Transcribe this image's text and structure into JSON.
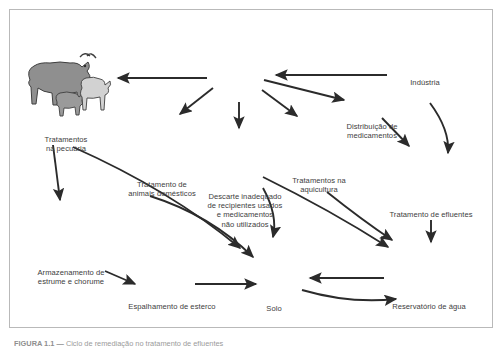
{
  "figure": {
    "type": "diagram",
    "background_color": "#ffffff",
    "border_color": "#b9b9b9",
    "text_color": "#3d3d3d",
    "arrow_color": "#2b2b2b"
  },
  "caption": {
    "label": "FIGURA 1.1 —",
    "text": "Ciclo de remediação no tratamento de efluentes"
  },
  "nodes": [
    {
      "id": "cattle",
      "icon": "cow-goat-icon",
      "label": "Tratamentos\nna pecuária"
    },
    {
      "id": "pets",
      "icon": "dog-cat-basket-icon",
      "label": "Tratamento de\nanimais domésticos"
    },
    {
      "id": "pills",
      "icon": "medicine-bottle-pills-icon",
      "label": ""
    },
    {
      "id": "trash",
      "icon": "trash-can-icon",
      "label": "Descarte inadequado\nde recipientes usados\ne medicamentos\nnão utilizados"
    },
    {
      "id": "aquaculture",
      "icon": "fish-farm-icon",
      "label": "Tratamentos na\naquicultura"
    },
    {
      "id": "truck",
      "icon": "delivery-truck-icon",
      "label": "Distribuição de\nmedicamentos"
    },
    {
      "id": "industry",
      "icon": "factory-icon",
      "label": "Indústria"
    },
    {
      "id": "effluent",
      "icon": "effluent-plant-icon",
      "label": "Tratamento de efluentes"
    },
    {
      "id": "manure",
      "icon": "manure-storage-icon",
      "label": "Armazenamento de\nestrume e chorume"
    },
    {
      "id": "tractor",
      "icon": "tractor-spreader-icon",
      "label": "Espalhamento de esterco"
    },
    {
      "id": "soil",
      "icon": "tree-soil-profile-icon",
      "label": "Solo"
    },
    {
      "id": "reservoir",
      "icon": "water-reservoir-icon",
      "label": "Reservatório de água"
    }
  ],
  "edges": [
    {
      "from": "pills",
      "to": "cattle"
    },
    {
      "from": "industry",
      "to": "pills"
    },
    {
      "from": "pills",
      "to": "pets"
    },
    {
      "from": "pills",
      "to": "trash"
    },
    {
      "from": "pills",
      "to": "aquaculture"
    },
    {
      "from": "pills",
      "to": "truck"
    },
    {
      "from": "industry",
      "to": "effluent"
    },
    {
      "from": "truck",
      "to": "effluent"
    },
    {
      "from": "cattle",
      "to": "manure"
    },
    {
      "from": "cattle",
      "to": "soil"
    },
    {
      "from": "manure",
      "to": "tractor"
    },
    {
      "from": "tractor",
      "to": "soil"
    },
    {
      "from": "pets",
      "to": "soil"
    },
    {
      "from": "trash",
      "to": "soil"
    },
    {
      "from": "trash",
      "to": "reservoir"
    },
    {
      "from": "aquaculture",
      "to": "reservoir"
    },
    {
      "from": "effluent",
      "to": "reservoir"
    },
    {
      "from": "reservoir",
      "to": "soil"
    },
    {
      "from": "soil",
      "to": "reservoir"
    }
  ]
}
